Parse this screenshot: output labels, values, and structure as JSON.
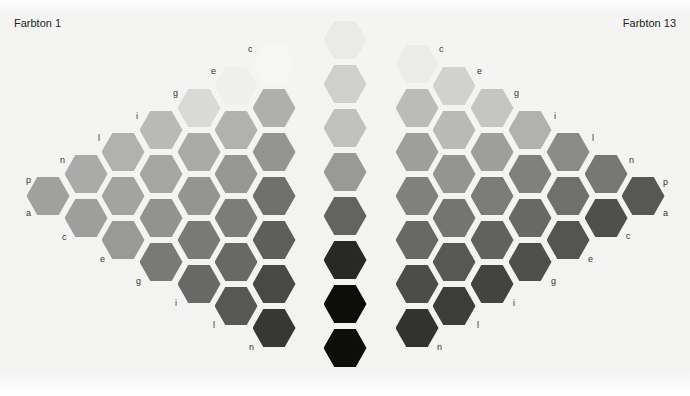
{
  "titles": {
    "left": "Farbton 1",
    "right": "Farbton 13"
  },
  "geometry": {
    "col_step_x": 37.6,
    "half_row_y": 22,
    "row_step_y": 44,
    "top_y": 64,
    "hex_w": 43,
    "hex_h": 38
  },
  "left_cluster": {
    "name": "Farbton 1",
    "columns": [
      {
        "x": 48,
        "lightness": [
          63
        ]
      },
      {
        "x": 86,
        "lightness": [
          67,
          62
        ]
      },
      {
        "x": 123,
        "lightness": [
          70,
          64,
          60
        ]
      },
      {
        "x": 161,
        "lightness": [
          73,
          65,
          57,
          47
        ]
      },
      {
        "x": 199,
        "lightness": [
          86,
          67,
          58,
          47,
          40
        ]
      },
      {
        "x": 236,
        "lightness": [
          95,
          70,
          59,
          48,
          40,
          33
        ]
      },
      {
        "x": 274,
        "lightness": [
          98,
          69,
          58,
          43,
          36,
          27,
          20
        ]
      }
    ],
    "labels": [
      {
        "text": "c",
        "x": 248,
        "y": 44
      },
      {
        "text": "e",
        "x": 211,
        "y": 66
      },
      {
        "text": "g",
        "x": 173,
        "y": 88
      },
      {
        "text": "i",
        "x": 136,
        "y": 111
      },
      {
        "text": "l",
        "x": 98,
        "y": 133
      },
      {
        "text": "n",
        "x": 60,
        "y": 155
      },
      {
        "text": "p",
        "x": 26,
        "y": 175
      },
      {
        "text": "a",
        "x": 26,
        "y": 208
      },
      {
        "text": "c",
        "x": 62,
        "y": 232
      },
      {
        "text": "e",
        "x": 100,
        "y": 254
      },
      {
        "text": "g",
        "x": 136,
        "y": 276
      },
      {
        "text": "i",
        "x": 175,
        "y": 298
      },
      {
        "text": "l",
        "x": 213,
        "y": 320
      },
      {
        "text": "n",
        "x": 249,
        "y": 342
      }
    ]
  },
  "center_column": {
    "x": 345,
    "ys": [
      40,
      84,
      128,
      172,
      216,
      260,
      304,
      348
    ],
    "lightness": [
      93,
      82,
      76,
      60,
      38,
      14,
      3,
      3
    ]
  },
  "right_cluster": {
    "name": "Farbton 13",
    "columns": [
      {
        "x": 417,
        "lightness": [
          94,
          74,
          62,
          50,
          40,
          28,
          18
        ]
      },
      {
        "x": 454,
        "lightness": [
          83,
          73,
          58,
          45,
          33,
          22
        ]
      },
      {
        "x": 492,
        "lightness": [
          78,
          62,
          48,
          37,
          25
        ]
      },
      {
        "x": 530,
        "lightness": [
          70,
          50,
          40,
          30
        ]
      },
      {
        "x": 568,
        "lightness": [
          54,
          43,
          32
        ]
      },
      {
        "x": 606,
        "lightness": [
          46,
          30
        ]
      },
      {
        "x": 643,
        "lightness": [
          33
        ]
      }
    ],
    "labels": [
      {
        "text": "c",
        "x": 439,
        "y": 44
      },
      {
        "text": "e",
        "x": 477,
        "y": 66
      },
      {
        "text": "g",
        "x": 514,
        "y": 88
      },
      {
        "text": "i",
        "x": 554,
        "y": 111
      },
      {
        "text": "l",
        "x": 592,
        "y": 133
      },
      {
        "text": "n",
        "x": 629,
        "y": 155
      },
      {
        "text": "p",
        "x": 663,
        "y": 177
      },
      {
        "text": "a",
        "x": 663,
        "y": 208
      },
      {
        "text": "c",
        "x": 626,
        "y": 231
      },
      {
        "text": "e",
        "x": 588,
        "y": 254
      },
      {
        "text": "g",
        "x": 551,
        "y": 276
      },
      {
        "text": "i",
        "x": 513,
        "y": 298
      },
      {
        "text": "l",
        "x": 477,
        "y": 320
      },
      {
        "text": "n",
        "x": 437,
        "y": 342
      }
    ]
  }
}
